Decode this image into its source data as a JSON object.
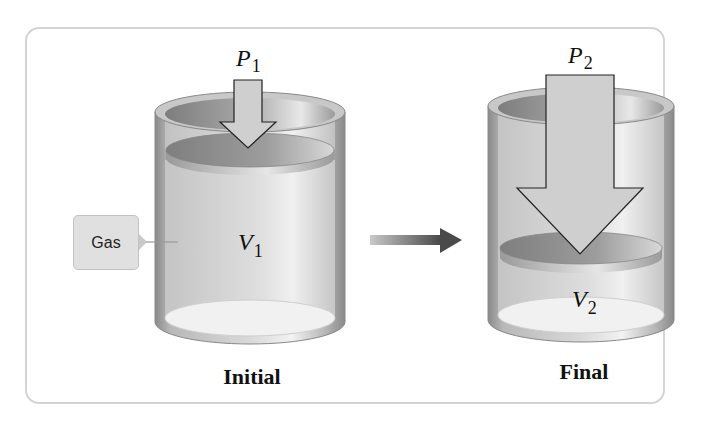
{
  "diagram": {
    "initial": {
      "pressure_label": "P",
      "pressure_subscript": "1",
      "volume_label": "V",
      "volume_subscript": "1",
      "caption": "Initial",
      "callout": "Gas"
    },
    "final": {
      "pressure_label": "P",
      "pressure_subscript": "2",
      "volume_label": "V",
      "volume_subscript": "2",
      "caption": "Final"
    },
    "colors": {
      "cylinder_wall": "#9a9a9a",
      "cylinder_interior": "#d6d6d6",
      "piston_top": "#8e8e8e",
      "arrow_fill": "#cfcfcf",
      "transition_arrow": "#555555",
      "panel_border": "#d4d4d4"
    }
  }
}
